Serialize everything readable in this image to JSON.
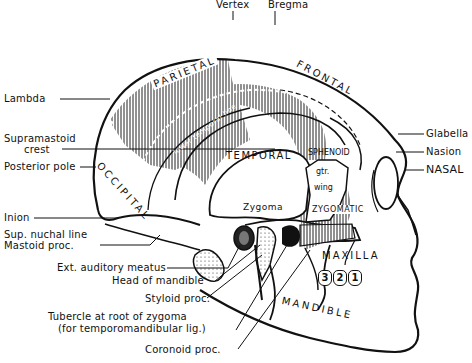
{
  "diagram": {
    "top_labels": {
      "vertex": "Vertex",
      "bregma": "Bregma"
    },
    "left_labels": {
      "lambda": "Lambda",
      "supramastoid_1": "Supramastoid",
      "supramastoid_2": "crest",
      "posterior_pole": "Posterior pole",
      "inion": "Inion",
      "sup_nuchal": "Sup. nuchal line",
      "mastoid": "Mastoid proc."
    },
    "bottom_labels": {
      "ext_auditory": "Ext. auditory meatus",
      "head_mandible": "Head of mandible",
      "styloid": "Styloid proc.",
      "tubercle_1": "Tubercle at root of zygoma",
      "tubercle_2": "(for temporomandibular lig.)",
      "coronoid": "Coronoid proc."
    },
    "right_labels": {
      "glabella": "Glabella",
      "nasion": "Nasion",
      "nasal": "NASAL"
    },
    "bones": {
      "parietal": "PARIETAL",
      "frontal": "FRONTAL",
      "occipital": "OCCIPITAL",
      "temporal": "TEMPORAL",
      "sphenoid": "SPHENOID",
      "gtr": "gtr.",
      "wing": "wing",
      "zygoma": "Zygoma",
      "zygomatic": "ZYGOMATIC",
      "maxilla": "MAXILLA",
      "mandible": "MANDIBLE",
      "lower_temporal_line": "lower temporal line"
    },
    "teeth": [
      "3",
      "2",
      "1"
    ],
    "colors": {
      "ink": "#111111",
      "paper": "#ffffff"
    }
  }
}
